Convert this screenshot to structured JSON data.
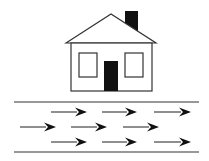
{
  "diagram": {
    "colors": {
      "background": "#ffffff",
      "stroke": "#333333",
      "fill_dark": "#111111",
      "window_fill": "#ffffff"
    },
    "house": {
      "roof": {
        "peak": [
          111,
          14
        ],
        "left": [
          66,
          43
        ],
        "right": [
          156,
          43
        ]
      },
      "chimney": {
        "x": 125,
        "y": 11,
        "w": 13,
        "h": 22
      },
      "walls": {
        "x": 71,
        "y": 43,
        "w": 81,
        "h": 48
      },
      "windows": [
        {
          "x": 79,
          "y": 53,
          "w": 18,
          "h": 24
        },
        {
          "x": 125,
          "y": 53,
          "w": 18,
          "h": 24
        }
      ],
      "door": {
        "x": 104,
        "y": 61,
        "w": 14,
        "h": 30
      }
    },
    "road": {
      "edges": [
        {
          "x1": 14,
          "x2": 199,
          "y": 102
        },
        {
          "x1": 14,
          "x2": 199,
          "y": 152
        }
      ],
      "arrows": [
        {
          "row": 1,
          "x1": 51,
          "x2": 87,
          "y": 112
        },
        {
          "row": 1,
          "x1": 102,
          "x2": 137,
          "y": 112
        },
        {
          "row": 1,
          "x1": 154,
          "x2": 191,
          "y": 112
        },
        {
          "row": 2,
          "x1": 20,
          "x2": 56,
          "y": 127
        },
        {
          "row": 2,
          "x1": 71,
          "x2": 107,
          "y": 127
        },
        {
          "row": 2,
          "x1": 123,
          "x2": 159,
          "y": 127
        },
        {
          "row": 3,
          "x1": 51,
          "x2": 87,
          "y": 142
        },
        {
          "row": 3,
          "x1": 102,
          "x2": 137,
          "y": 142
        },
        {
          "row": 3,
          "x1": 154,
          "x2": 191,
          "y": 142
        }
      ],
      "direction": "right"
    }
  }
}
